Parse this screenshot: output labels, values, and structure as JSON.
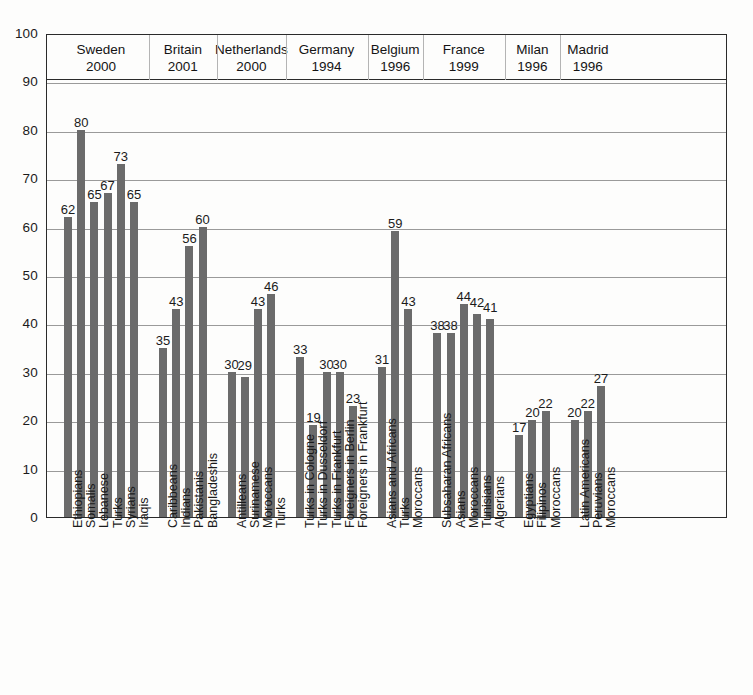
{
  "chart_data": {
    "type": "bar",
    "title": "",
    "xlabel": "",
    "ylabel": "",
    "ylim": [
      0,
      100
    ],
    "ytick_labels": [
      "100",
      "90",
      "80",
      "70",
      "60",
      "50",
      "40",
      "30",
      "20",
      "10",
      "0"
    ],
    "ytick_values": [
      100,
      90,
      80,
      70,
      60,
      50,
      40,
      30,
      20,
      10,
      0
    ],
    "grid": true,
    "legend": "none",
    "orientation": "vertical",
    "bar_color": "#6b6b6b",
    "groups": [
      {
        "country": "Sweden",
        "year": "2000",
        "categories": [
          "Ethiopians",
          "Somalis",
          "Lebanese",
          "Turks",
          "Syrians",
          "Iraqis"
        ],
        "values": [
          62,
          80,
          65,
          67,
          73,
          65
        ]
      },
      {
        "country": "Britain",
        "year": "2001",
        "categories": [
          "Caribbeans",
          "Indians",
          "Pakistanis",
          "Bangladeshis"
        ],
        "values": [
          35,
          43,
          56,
          60
        ]
      },
      {
        "country": "Netherlands",
        "year": "2000",
        "categories": [
          "Antilleans",
          "Surinamese",
          "Moroccans",
          "Turks"
        ],
        "values": [
          30,
          29,
          43,
          46
        ]
      },
      {
        "country": "Germany",
        "year": "1994",
        "categories": [
          "Turks in Cologne",
          "Turks in Dusseldorf",
          "Turks in Frankfurt",
          "Foreigners in Berlin",
          "Foreigners in Frankfurt"
        ],
        "values": [
          33,
          19,
          30,
          30,
          23
        ]
      },
      {
        "country": "Belgium",
        "year": "1996",
        "categories": [
          "Asians and Africans",
          "Turks",
          "Moroccans"
        ],
        "values": [
          31,
          59,
          43
        ]
      },
      {
        "country": "France",
        "year": "1999",
        "categories": [
          "Subsaharan Africans",
          "Asians",
          "Moroccans",
          "Tunisians",
          "Algerians"
        ],
        "values": [
          38,
          38,
          44,
          42,
          41
        ]
      },
      {
        "country": "Milan",
        "year": "1996",
        "categories": [
          "Egyptians",
          "Filipinos",
          "Moroccans"
        ],
        "values": [
          17,
          20,
          22
        ]
      },
      {
        "country": "Madrid",
        "year": "1996",
        "categories": [
          "Latin Americans",
          "Peruvians",
          "Moroccans"
        ],
        "values": [
          20,
          22,
          27
        ]
      }
    ]
  }
}
